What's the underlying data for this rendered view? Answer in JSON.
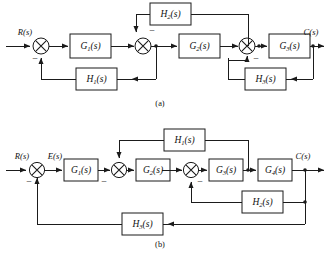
{
  "figure": {
    "background_color": "#ffffff",
    "line_color": "#1b1b1b",
    "width": 328,
    "height": 257
  },
  "diagram_a": {
    "caption": "(a)",
    "input_label": "R(s)",
    "output_label": "C(s)",
    "forward_blocks": [
      {
        "id": "a-g1",
        "label": "G",
        "subscript": "1",
        "arg": "(s)",
        "full": "G₁(s)"
      },
      {
        "id": "a-g2",
        "label": "G",
        "subscript": "2",
        "arg": "(s)",
        "full": "G₂(s)"
      },
      {
        "id": "a-g3",
        "label": "G",
        "subscript": "3",
        "arg": "(s)",
        "full": "G₃(s)"
      }
    ],
    "feedback_blocks": [
      {
        "id": "a-h2",
        "label": "H",
        "subscript": "2",
        "arg": "(s)",
        "full": "H₂(s)",
        "position": "upper-inner"
      },
      {
        "id": "a-h1",
        "label": "H",
        "subscript": "1",
        "arg": "(s)",
        "full": "H₁(s)",
        "position": "lower-left"
      },
      {
        "id": "a-h3",
        "label": "H",
        "subscript": "3",
        "arg": "(s)",
        "full": "H₃(s)",
        "position": "lower-right"
      }
    ],
    "summing_junctions": [
      {
        "id": "a-sum1",
        "sign": "−",
        "sign_position": "bottom"
      },
      {
        "id": "a-sum2",
        "sign": "−",
        "sign_position": "top-right"
      },
      {
        "id": "a-sum3",
        "sign": "−",
        "sign_position": "bottom-right"
      }
    ]
  },
  "diagram_b": {
    "caption": "(b)",
    "input_label": "R(s)",
    "error_label": "E(s)",
    "output_label": "C(s)",
    "forward_blocks": [
      {
        "id": "b-g1",
        "label": "G",
        "subscript": "1",
        "arg": "(s)",
        "full": "G₁(s)"
      },
      {
        "id": "b-g2",
        "label": "G",
        "subscript": "2",
        "arg": "(s)",
        "full": "G₂(s)"
      },
      {
        "id": "b-g3",
        "label": "G",
        "subscript": "3",
        "arg": "(s)",
        "full": "G₃(s)"
      },
      {
        "id": "b-g4",
        "label": "G",
        "subscript": "4",
        "arg": "(s)",
        "full": "G₄(s)"
      }
    ],
    "feedback_blocks": [
      {
        "id": "b-h1",
        "label": "H",
        "subscript": "1",
        "arg": "(s)",
        "full": "H₁(s)",
        "position": "upper-inner"
      },
      {
        "id": "b-h2",
        "label": "H",
        "subscript": "2",
        "arg": "(s)",
        "full": "H₂(s)",
        "position": "middle-right"
      },
      {
        "id": "b-h3",
        "label": "H",
        "subscript": "3",
        "arg": "(s)",
        "full": "H₃(s)",
        "position": "outer-bottom"
      }
    ],
    "summing_junctions": [
      {
        "id": "b-sum1",
        "sign": "−",
        "sign_position": "bottom-left"
      },
      {
        "id": "b-sum2",
        "sign": "−",
        "sign_position": "left"
      },
      {
        "id": "b-sum3",
        "sign": "−",
        "sign_position": "bottom-right"
      }
    ]
  }
}
